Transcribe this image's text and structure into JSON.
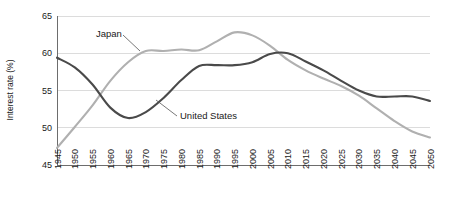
{
  "chart_data": {
    "type": "line",
    "title": "",
    "xlabel": "",
    "ylabel": "Interest rate (%)",
    "ylim": [
      45,
      65
    ],
    "yticks": [
      45,
      50,
      55,
      60,
      65
    ],
    "grid": true,
    "legend_position": "inline-annotations",
    "x": [
      1945,
      1950,
      1955,
      1960,
      1965,
      1970,
      1975,
      1980,
      1985,
      1990,
      1995,
      2000,
      2005,
      2010,
      2015,
      2020,
      2025,
      2030,
      2035,
      2040,
      2045,
      2050
    ],
    "categories": [
      "1945",
      "1950",
      "1955",
      "1960",
      "1965",
      "1970",
      "1975",
      "1980",
      "1985",
      "1990",
      "1995",
      "2000",
      "2005",
      "2010",
      "2015",
      "2020",
      "2025",
      "2030",
      "2035",
      "2040",
      "2045",
      "2050"
    ],
    "series": [
      {
        "name": "Japan",
        "color": "#b0b0b0",
        "values": [
          47.3,
          50.1,
          53.0,
          56.3,
          58.8,
          60.3,
          60.3,
          60.5,
          60.4,
          61.6,
          62.8,
          62.4,
          61.0,
          59.1,
          57.7,
          56.6,
          55.6,
          54.3,
          52.6,
          50.9,
          49.5,
          48.7
        ]
      },
      {
        "name": "United States",
        "color": "#4a4a4a",
        "values": [
          59.4,
          58.1,
          55.8,
          52.7,
          51.3,
          52.1,
          54.0,
          56.4,
          58.3,
          58.4,
          58.4,
          58.8,
          59.9,
          60.0,
          58.9,
          57.7,
          56.3,
          55.0,
          54.2,
          54.2,
          54.2,
          53.6
        ]
      }
    ],
    "annotations": [
      {
        "text": "Japan",
        "label_x": 96,
        "label_y": 37,
        "leader": [
          [
            123,
            35
          ],
          [
            140,
            51
          ]
        ]
      },
      {
        "text": "United States",
        "label_x": 180,
        "label_y": 119,
        "leader": [
          [
            177,
            116
          ],
          [
            156,
            100
          ]
        ]
      }
    ]
  },
  "plot_geometry": {
    "left": 57,
    "right": 430,
    "top": 16,
    "bottom": 165
  }
}
